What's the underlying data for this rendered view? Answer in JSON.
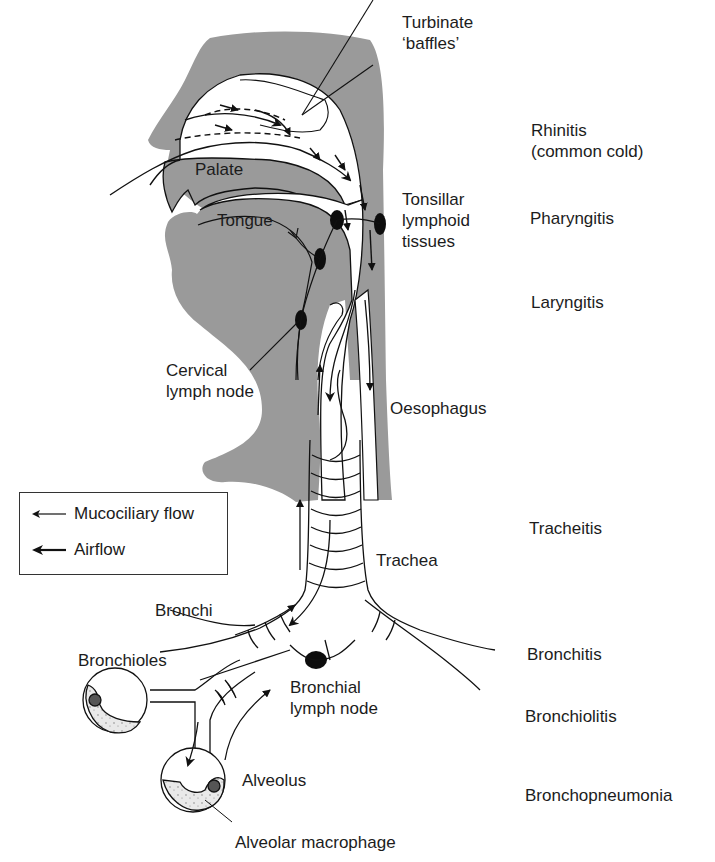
{
  "anatomy_labels": {
    "turbinate": "Turbinate\n‘baffles’",
    "palate": "Palate",
    "tongue": "Tongue",
    "tonsillar": "Tonsillar\nlymphoid\ntissues",
    "cervical": "Cervical\nlymph node",
    "oesophagus": "Oesophagus",
    "trachea": "Trachea",
    "bronchi": "Bronchi",
    "bronchioles": "Bronchioles",
    "bronchial_node": "Bronchial\nlymph node",
    "alveolus": "Alveolus",
    "alveolar_macrophage": "Alveolar macrophage"
  },
  "conditions": [
    {
      "label": "Rhinitis\n(common cold)",
      "region": "nose"
    },
    {
      "label": "Pharyngitis",
      "region": "pharynx"
    },
    {
      "label": "Laryngitis",
      "region": "larynx"
    },
    {
      "label": "Tracheitis",
      "region": "trachea"
    },
    {
      "label": "Bronchitis",
      "region": "bronchi"
    },
    {
      "label": "Bronchiolitis",
      "region": "bronchioles"
    },
    {
      "label": "Bronchopneumonia",
      "region": "alveoli"
    }
  ],
  "legend": {
    "items": [
      {
        "icon": "thin-arrow-left-icon",
        "label": "Mucociliary flow"
      },
      {
        "icon": "bold-arrow-left-icon",
        "label": "Airflow"
      }
    ]
  },
  "colors": {
    "tissue_gray": "#9a9a9a",
    "line": "#111111",
    "macrophage_fill": "#e6e6e6",
    "node": "#0d0d0d"
  }
}
